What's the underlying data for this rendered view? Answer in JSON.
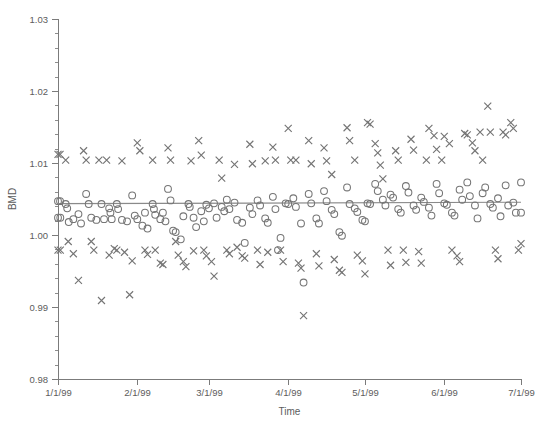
{
  "chart_data": {
    "type": "scatter",
    "title": "",
    "xlabel": "Time",
    "ylabel": "BMD",
    "ylim": [
      0.98,
      1.03
    ],
    "ytick_step": 0.01,
    "yticks": [
      0.98,
      0.99,
      1.0,
      1.01,
      1.02,
      1.03
    ],
    "ytick_labels": [
      "0.98",
      "0.99",
      "1.00",
      "1.01",
      "1.02",
      "1.03"
    ],
    "y_minor_ticks_per_major": 5,
    "xlim_days": [
      0,
      181
    ],
    "xticks_days": [
      0,
      31,
      59,
      90,
      120,
      151,
      181
    ],
    "xtick_labels": [
      "1/1/99",
      "2/1/99",
      "3/1/99",
      "4/1/99",
      "5/1/99",
      "6/1/99",
      "7/1/99"
    ],
    "grid": false,
    "legend": null,
    "marker_color": "#757575",
    "line_color": "#8a8a8a",
    "reference_line": {
      "label": "fitted trend",
      "x_days": [
        0,
        181
      ],
      "y": [
        1.00435,
        1.00455
      ]
    },
    "series": [
      {
        "name": "circle-series",
        "marker": "circle",
        "points": [
          [
            0,
            1.0047
          ],
          [
            0.8,
            1.0047
          ],
          [
            0,
            1.0024
          ],
          [
            0.9,
            1.0024
          ],
          [
            3,
            1.0043
          ],
          [
            3.6,
            1.0037
          ],
          [
            4.2,
            1.0018
          ],
          [
            6,
            1.0022
          ],
          [
            8,
            1.0029
          ],
          [
            9,
            1.0016
          ],
          [
            11,
            1.0057
          ],
          [
            12,
            1.0043
          ],
          [
            13,
            1.0024
          ],
          [
            15,
            1.0021
          ],
          [
            17,
            1.0043
          ],
          [
            18,
            1.0022
          ],
          [
            20,
            1.0037
          ],
          [
            20.5,
            1.0031
          ],
          [
            21,
            1.0022
          ],
          [
            23,
            1.0043
          ],
          [
            23.5,
            1.0036
          ],
          [
            25,
            1.0021
          ],
          [
            27,
            1.0019
          ],
          [
            29,
            1.0055
          ],
          [
            30,
            1.0027
          ],
          [
            31,
            1.0022
          ],
          [
            33,
            1.0013
          ],
          [
            34,
            1.0031
          ],
          [
            35,
            1.0009
          ],
          [
            37,
            1.0043
          ],
          [
            37.5,
            1.0036
          ],
          [
            38,
            1.0028
          ],
          [
            40,
            1.0022
          ],
          [
            41,
            1.0031
          ],
          [
            42,
            1.0019
          ],
          [
            43,
            1.0064
          ],
          [
            44,
            1.0048
          ],
          [
            45,
            1.0006
          ],
          [
            46,
            1.0004
          ],
          [
            48,
            0.9994
          ],
          [
            49,
            1.0026
          ],
          [
            51,
            1.0043
          ],
          [
            51.5,
            1.0039
          ],
          [
            53,
            1.0024
          ],
          [
            54,
            1.0011
          ],
          [
            56,
            1.0033
          ],
          [
            57,
            1.0019
          ],
          [
            58,
            1.0042
          ],
          [
            59,
            1.0037
          ],
          [
            61,
            1.0044
          ],
          [
            62,
            1.0024
          ],
          [
            64,
            1.0039
          ],
          [
            65,
            1.0033
          ],
          [
            66,
            1.0049
          ],
          [
            67,
            1.0036
          ],
          [
            69,
            1.0045
          ],
          [
            70,
            1.0021
          ],
          [
            72,
            1.0017
          ],
          [
            73,
            0.9989
          ],
          [
            75,
            1.0038
          ],
          [
            76,
            1.0029
          ],
          [
            78,
            1.0048
          ],
          [
            79,
            1.0041
          ],
          [
            81,
            1.0023
          ],
          [
            82,
            1.0017
          ],
          [
            84,
            1.0053
          ],
          [
            85,
            1.0036
          ],
          [
            86,
            0.9979
          ],
          [
            87,
            0.9996
          ],
          [
            89,
            1.0044
          ],
          [
            90,
            1.0043
          ],
          [
            92,
            1.0051
          ],
          [
            93,
            1.0039
          ],
          [
            95,
            1.0016
          ],
          [
            96,
            0.9934
          ],
          [
            98,
            1.0057
          ],
          [
            99,
            1.0044
          ],
          [
            101,
            1.0023
          ],
          [
            102,
            1.0016
          ],
          [
            104,
            1.0061
          ],
          [
            105,
            1.0047
          ],
          [
            107,
            1.0035
          ],
          [
            108,
            1.0029
          ],
          [
            110,
            1.0004
          ],
          [
            111,
            0.9999
          ],
          [
            113,
            1.0066
          ],
          [
            114,
            1.0043
          ],
          [
            116,
            1.0037
          ],
          [
            117,
            1.0032
          ],
          [
            119,
            1.0021
          ],
          [
            120,
            1.0019
          ],
          [
            121,
            1.0044
          ],
          [
            122,
            1.0043
          ],
          [
            124,
            1.0071
          ],
          [
            125,
            1.0061
          ],
          [
            127,
            1.0049
          ],
          [
            128,
            1.0041
          ],
          [
            130,
            1.0056
          ],
          [
            131,
            1.0052
          ],
          [
            133,
            1.0036
          ],
          [
            134,
            1.0031
          ],
          [
            136,
            1.0068
          ],
          [
            137,
            1.0059
          ],
          [
            139,
            1.0041
          ],
          [
            140,
            1.0035
          ],
          [
            142,
            1.0052
          ],
          [
            143,
            1.0046
          ],
          [
            145,
            1.0038
          ],
          [
            146,
            1.0027
          ],
          [
            148,
            1.0071
          ],
          [
            149,
            1.0058
          ],
          [
            151,
            1.0044
          ],
          [
            152,
            1.0042
          ],
          [
            154,
            1.0031
          ],
          [
            155,
            1.0027
          ],
          [
            157,
            1.0063
          ],
          [
            158,
            1.0049
          ],
          [
            160,
            1.0073
          ],
          [
            161,
            1.0054
          ],
          [
            163,
            1.0041
          ],
          [
            164,
            1.0023
          ],
          [
            166,
            1.0058
          ],
          [
            167,
            1.0066
          ],
          [
            169,
            1.0043
          ],
          [
            170,
            1.0038
          ],
          [
            172,
            1.0051
          ],
          [
            173,
            1.0026
          ],
          [
            175,
            1.0069
          ],
          [
            176,
            1.0041
          ],
          [
            178,
            1.0045
          ],
          [
            179,
            1.0031
          ],
          [
            181,
            1.0073
          ],
          [
            181,
            1.0031
          ]
        ]
      },
      {
        "name": "cross-series",
        "marker": "cross",
        "points": [
          [
            0,
            1.0112
          ],
          [
            0.8,
            1.0112
          ],
          [
            0,
            0.9979
          ],
          [
            0.9,
            0.9979
          ],
          [
            3,
            1.0104
          ],
          [
            4,
            0.9991
          ],
          [
            6,
            0.9974
          ],
          [
            8,
            0.9937
          ],
          [
            10,
            1.0117
          ],
          [
            11,
            1.0104
          ],
          [
            13,
            0.9991
          ],
          [
            14,
            0.9979
          ],
          [
            16,
            1.0104
          ],
          [
            17,
            0.9909
          ],
          [
            19,
            1.0104
          ],
          [
            20,
            0.9972
          ],
          [
            22,
            0.9981
          ],
          [
            23,
            0.9979
          ],
          [
            25,
            1.0103
          ],
          [
            26,
            0.9976
          ],
          [
            28,
            0.9917
          ],
          [
            29,
            0.9964
          ],
          [
            31,
            1.0128
          ],
          [
            32,
            1.0117
          ],
          [
            34,
            0.9979
          ],
          [
            35,
            0.9973
          ],
          [
            37,
            1.0104
          ],
          [
            38,
            0.9979
          ],
          [
            40,
            0.9961
          ],
          [
            41,
            0.9959
          ],
          [
            43,
            1.0121
          ],
          [
            44,
            1.0104
          ],
          [
            46,
            0.9991
          ],
          [
            47,
            0.9972
          ],
          [
            49,
            0.9963
          ],
          [
            50,
            0.9956
          ],
          [
            52,
            1.0103
          ],
          [
            53,
            0.9978
          ],
          [
            55,
            1.0131
          ],
          [
            56,
            1.0111
          ],
          [
            57,
            0.9979
          ],
          [
            58,
            0.9971
          ],
          [
            60,
            0.9963
          ],
          [
            61,
            0.9943
          ],
          [
            63,
            1.0104
          ],
          [
            64,
            1.0079
          ],
          [
            66,
            0.9979
          ],
          [
            67,
            0.9974
          ],
          [
            69,
            1.0098
          ],
          [
            70,
            0.9983
          ],
          [
            72,
            0.9971
          ],
          [
            73,
            0.9968
          ],
          [
            75,
            1.0126
          ],
          [
            76,
            1.0099
          ],
          [
            78,
            0.9979
          ],
          [
            79,
            0.9959
          ],
          [
            81,
            1.0103
          ],
          [
            82,
            0.9976
          ],
          [
            84,
            1.0122
          ],
          [
            85,
            1.0104
          ],
          [
            87,
            0.9979
          ],
          [
            88,
            0.9963
          ],
          [
            90,
            1.0148
          ],
          [
            91,
            1.0104
          ],
          [
            93,
            1.0104
          ],
          [
            94,
            0.9961
          ],
          [
            95,
            0.9954
          ],
          [
            96,
            0.9888
          ],
          [
            98,
            1.0131
          ],
          [
            99,
            1.0099
          ],
          [
            101,
            0.9974
          ],
          [
            102,
            0.9957
          ],
          [
            104,
            1.0121
          ],
          [
            105,
            1.0103
          ],
          [
            107,
            1.0084
          ],
          [
            108,
            0.9966
          ],
          [
            110,
            0.9951
          ],
          [
            111,
            0.9948
          ],
          [
            113,
            1.0149
          ],
          [
            114,
            1.0131
          ],
          [
            116,
            1.0104
          ],
          [
            117,
            0.9972
          ],
          [
            119,
            0.9964
          ],
          [
            120,
            0.9946
          ],
          [
            121,
            1.0156
          ],
          [
            122,
            1.0154
          ],
          [
            124,
            1.0127
          ],
          [
            125,
            1.0114
          ],
          [
            126,
            1.0097
          ],
          [
            127,
            1.0078
          ],
          [
            129,
            0.9979
          ],
          [
            130,
            0.9958
          ],
          [
            132,
            1.0117
          ],
          [
            133,
            1.0104
          ],
          [
            135,
            0.9979
          ],
          [
            136,
            0.9962
          ],
          [
            138,
            1.0133
          ],
          [
            139,
            1.0118
          ],
          [
            141,
            0.9977
          ],
          [
            142,
            0.9961
          ],
          [
            144,
            1.0104
          ],
          [
            145,
            1.0148
          ],
          [
            147,
            1.0138
          ],
          [
            148,
            1.0119
          ],
          [
            150,
            1.0104
          ],
          [
            151,
            1.0137
          ],
          [
            153,
            1.0127
          ],
          [
            154,
            0.9979
          ],
          [
            156,
            0.9971
          ],
          [
            157,
            0.9963
          ],
          [
            159,
            1.0141
          ],
          [
            160,
            1.0139
          ],
          [
            162,
            1.0128
          ],
          [
            163,
            1.0117
          ],
          [
            165,
            1.0143
          ],
          [
            166,
            1.0104
          ],
          [
            168,
            1.0179
          ],
          [
            169,
            1.0143
          ],
          [
            171,
            0.9979
          ],
          [
            172,
            0.9967
          ],
          [
            174,
            1.0143
          ],
          [
            175,
            1.0139
          ],
          [
            177,
            1.0156
          ],
          [
            178,
            1.0148
          ],
          [
            180,
            0.9979
          ],
          [
            181,
            0.9988
          ]
        ]
      }
    ]
  }
}
